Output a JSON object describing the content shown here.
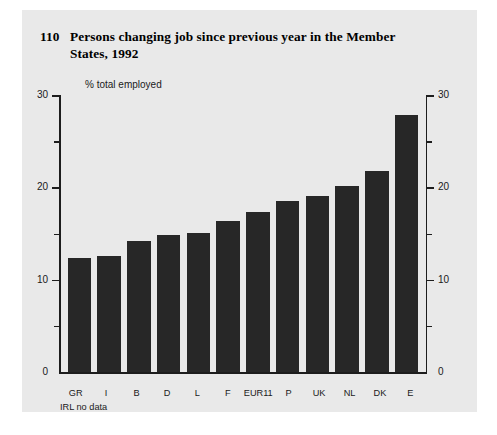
{
  "figure": {
    "number": "110",
    "title": "Persons changing job since previous year in the Member States, 1992",
    "note": "IRL no data",
    "axis_caption": "% total employed",
    "bar_color": "#272727",
    "panel_color": "#e9e9e9",
    "axis_color": "#1d1d1d"
  },
  "chart_data": {
    "type": "bar",
    "title": "Persons changing job since previous year in the Member States, 1992",
    "xlabel": "",
    "ylabel": "% total employed",
    "ylim": [
      0,
      30
    ],
    "yticks": [
      0,
      5,
      10,
      15,
      20,
      25,
      30
    ],
    "ytick_labels_major": [
      "0",
      "10",
      "20",
      "30"
    ],
    "grid": false,
    "legend": "none",
    "dual_axis": true,
    "annotations": [
      "IRL no data"
    ],
    "categories": [
      "GR",
      "I",
      "B",
      "D",
      "L",
      "F",
      "EUR11",
      "P",
      "UK",
      "NL",
      "DK",
      "E"
    ],
    "values": [
      12.3,
      12.6,
      14.2,
      14.8,
      15.1,
      16.4,
      17.3,
      18.5,
      19.1,
      20.2,
      21.8,
      27.8
    ]
  },
  "yaxis": {
    "labels": [
      "30",
      "20",
      "10",
      "0"
    ]
  }
}
